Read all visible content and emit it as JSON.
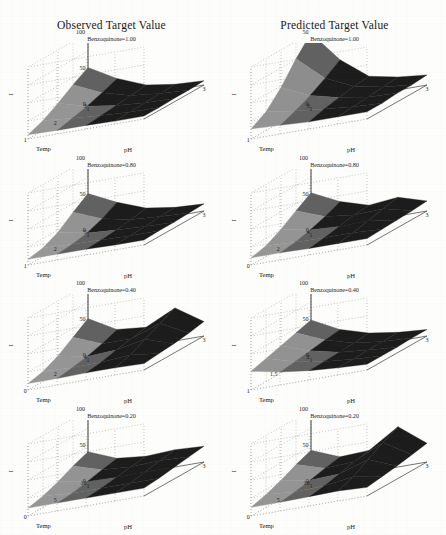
{
  "figure": {
    "column_titles": [
      "Observed Target Value",
      "Predicted Target Value"
    ],
    "axis_labels": {
      "x": "pH",
      "y": "Temp",
      "z": "I"
    }
  },
  "chart_data": {
    "type": "surface",
    "grid": {
      "rows": 4,
      "cols": 2
    },
    "column_titles": [
      "Observed Target Value",
      "Predicted Target Value"
    ],
    "xlabel": "pH",
    "ylabel": "Temp",
    "zlabel": "I",
    "grid_on": true,
    "legend": "none",
    "surface_colors": {
      "light": "#9a9a9a",
      "dark": "#1c1c1c",
      "mid": "#6a6a6a"
    },
    "panels": [
      {
        "row": 1,
        "col": 1,
        "subtitle": "Benzoquinone=1.00",
        "series_name": "Observed",
        "zticks": [
          "100",
          "50",
          "0"
        ],
        "zlim": [
          0,
          100
        ],
        "yticks": [
          "3",
          "2",
          "1"
        ],
        "ylim": [
          1,
          3
        ],
        "xticks": [
          "1",
          "2",
          "3"
        ],
        "xlim": [
          1,
          3
        ],
        "x": [
          1,
          1.5,
          2,
          2.5,
          3
        ],
        "y": [
          1,
          1.5,
          2,
          2.5,
          3
        ],
        "z": [
          [
            52,
            30,
            14,
            8,
            6
          ],
          [
            40,
            22,
            11,
            7,
            5
          ],
          [
            26,
            15,
            9,
            6,
            5
          ],
          [
            14,
            10,
            7,
            5,
            4
          ],
          [
            6,
            5,
            5,
            4,
            4
          ]
        ]
      },
      {
        "row": 1,
        "col": 2,
        "subtitle": "Benzoquinone=1.00",
        "series_name": "Predicted",
        "zticks": [
          "50",
          "0"
        ],
        "zlim": [
          0,
          50
        ],
        "yticks": [
          "3",
          "1"
        ],
        "ylim": [
          1,
          3
        ],
        "xticks": [
          "1",
          "2",
          "3"
        ],
        "xlim": [
          1,
          3
        ],
        "x": [
          1,
          1.5,
          2,
          2.5,
          3
        ],
        "y": [
          1,
          1.5,
          2,
          2.5,
          3
        ],
        "z": [
          [
            50,
            28,
            13,
            9,
            7
          ],
          [
            38,
            21,
            12,
            8,
            6
          ],
          [
            24,
            15,
            10,
            7,
            6
          ],
          [
            13,
            10,
            8,
            6,
            5
          ],
          [
            7,
            6,
            5,
            5,
            5
          ]
        ]
      },
      {
        "row": 2,
        "col": 1,
        "subtitle": "Benzoquinone=0.80",
        "series_name": "Observed",
        "zticks": [
          "100",
          "50",
          "0"
        ],
        "zlim": [
          0,
          100
        ],
        "yticks": [
          "5",
          "2",
          "1"
        ],
        "ylim": [
          0,
          5
        ],
        "xticks": [
          "1",
          "2",
          "3"
        ],
        "xlim": [
          1,
          3
        ],
        "x": [
          1,
          1.5,
          2,
          2.5,
          3
        ],
        "y": [
          1,
          2,
          3,
          4,
          5
        ],
        "z": [
          [
            52,
            33,
            18,
            12,
            10
          ],
          [
            38,
            22,
            14,
            11,
            9
          ],
          [
            22,
            14,
            11,
            9,
            8
          ],
          [
            12,
            10,
            9,
            8,
            8
          ],
          [
            8,
            8,
            8,
            7,
            7
          ]
        ]
      },
      {
        "row": 2,
        "col": 2,
        "subtitle": "Benzoquinone=0.80",
        "series_name": "Predicted",
        "zticks": [
          "100",
          "50",
          "0"
        ],
        "zlim": [
          0,
          100
        ],
        "yticks": [
          "4",
          "2",
          "0"
        ],
        "ylim": [
          0,
          4
        ],
        "xticks": [
          "1",
          "2",
          "3"
        ],
        "xlim": [
          1,
          3
        ],
        "x": [
          1,
          1.5,
          2,
          2.5,
          3
        ],
        "y": [
          0,
          1,
          2,
          3,
          4
        ],
        "z": [
          [
            53,
            34,
            22,
            26,
            14
          ],
          [
            40,
            25,
            20,
            22,
            12
          ],
          [
            26,
            18,
            16,
            17,
            11
          ],
          [
            15,
            13,
            12,
            12,
            10
          ],
          [
            10,
            10,
            9,
            9,
            9
          ]
        ]
      },
      {
        "row": 3,
        "col": 1,
        "subtitle": "Benzoquinone=0.40",
        "series_name": "Observed",
        "zticks": [
          "100",
          "50",
          "0"
        ],
        "zlim": [
          0,
          100
        ],
        "yticks": [
          "4",
          "2",
          "0"
        ],
        "ylim": [
          0,
          4
        ],
        "xticks": [
          "1",
          "2",
          "3"
        ],
        "xlim": [
          1,
          3
        ],
        "x": [
          1,
          1.5,
          2,
          2.5,
          3
        ],
        "y": [
          0,
          1,
          2,
          3,
          4
        ],
        "z": [
          [
            52,
            30,
            26,
            46,
            20
          ],
          [
            38,
            22,
            22,
            36,
            16
          ],
          [
            24,
            16,
            18,
            26,
            13
          ],
          [
            14,
            12,
            13,
            16,
            11
          ],
          [
            9,
            9,
            10,
            10,
            9
          ]
        ]
      },
      {
        "row": 3,
        "col": 2,
        "subtitle": "Benzoquinone=0.40",
        "series_name": "Predicted",
        "zticks": [
          "100",
          "50",
          "0"
        ],
        "zlim": [
          0,
          100
        ],
        "yticks": [
          "2",
          "1.5",
          "1"
        ],
        "ylim": [
          1,
          2
        ],
        "xticks": [
          "1",
          "2",
          "3"
        ],
        "xlim": [
          1,
          3
        ],
        "x": [
          1,
          1.5,
          2,
          2.5,
          3
        ],
        "y": [
          1,
          1.25,
          1.5,
          1.75,
          2
        ],
        "z": [
          [
            50,
            30,
            18,
            12,
            9
          ],
          [
            44,
            27,
            16,
            11,
            9
          ],
          [
            38,
            24,
            15,
            11,
            8
          ],
          [
            32,
            21,
            14,
            10,
            8
          ],
          [
            26,
            18,
            13,
            10,
            8
          ]
        ]
      },
      {
        "row": 4,
        "col": 1,
        "subtitle": "Benzoquinone=0.20",
        "series_name": "Observed",
        "zticks": [
          "100",
          "50",
          "0"
        ],
        "zlim": [
          0,
          100
        ],
        "yticks": [
          "10",
          "5",
          "0"
        ],
        "ylim": [
          0,
          10
        ],
        "xticks": [
          "1",
          "2",
          "3"
        ],
        "xlim": [
          1,
          3
        ],
        "x": [
          1,
          1.5,
          2,
          2.5,
          3
        ],
        "y": [
          0,
          2.5,
          5,
          7.5,
          10
        ],
        "z": [
          [
            42,
            26,
            22,
            24,
            22
          ],
          [
            34,
            22,
            19,
            21,
            19
          ],
          [
            24,
            17,
            16,
            17,
            16
          ],
          [
            16,
            13,
            13,
            13,
            13
          ],
          [
            11,
            11,
            11,
            11,
            11
          ]
        ]
      },
      {
        "row": 4,
        "col": 2,
        "subtitle": "Benzoquinone=0.20",
        "series_name": "Predicted",
        "zticks": [
          "100",
          "50",
          "0"
        ],
        "zlim": [
          0,
          100
        ],
        "yticks": [
          "10",
          "5",
          "0"
        ],
        "ylim": [
          0,
          10
        ],
        "xticks": [
          "1",
          "2",
          "3"
        ],
        "xlim": [
          1,
          3
        ],
        "x": [
          1,
          1.5,
          2,
          2.5,
          3
        ],
        "y": [
          0,
          2.5,
          5,
          7.5,
          10
        ],
        "z": [
          [
            44,
            28,
            30,
            56,
            26
          ],
          [
            36,
            24,
            26,
            46,
            22
          ],
          [
            26,
            19,
            21,
            34,
            18
          ],
          [
            18,
            15,
            16,
            22,
            15
          ],
          [
            12,
            12,
            13,
            14,
            12
          ]
        ]
      }
    ]
  }
}
